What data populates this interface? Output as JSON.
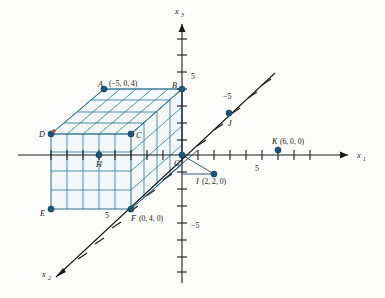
{
  "figure": {
    "background_color": "#fdfdfb",
    "axis_color": "#1a1a1a",
    "box_color": "#2e6d8e",
    "point_color": "#1b5579",
    "accent_color": "#b5432a"
  },
  "axes": [
    {
      "name": "x1",
      "label": "x",
      "subscript": "1",
      "direction": "right",
      "arrow": true
    },
    {
      "name": "x2",
      "label": "x",
      "subscript": "2",
      "direction": "lower-left",
      "arrow": true
    },
    {
      "name": "x3",
      "label": "x",
      "subscript": "3",
      "direction": "up",
      "arrow": true
    }
  ],
  "tick_labels": [
    {
      "name": "x3-positive-5",
      "text": "5",
      "axis": "x3",
      "value": 5
    },
    {
      "name": "x3-negative-5",
      "text": "-5",
      "axis": "x3",
      "value": -5
    },
    {
      "name": "x1-positive-5",
      "text": "5",
      "axis": "x1",
      "value": 5
    },
    {
      "name": "x2-positive-5",
      "text": "5",
      "axis": "x2",
      "value": 5
    },
    {
      "name": "x2-negative-5",
      "text": "-5",
      "axis": "x2",
      "value": -5
    }
  ],
  "points": [
    {
      "name": "point-A",
      "label": "A",
      "coords": "(-5, 0, 4)",
      "show_coords": true,
      "x": -5,
      "y": 0,
      "z": 4
    },
    {
      "name": "point-B",
      "label": "B",
      "coords": "(0, 0, 4)",
      "show_coords": false,
      "x": 0,
      "y": 0,
      "z": 4
    },
    {
      "name": "point-C",
      "label": "C",
      "coords": "(0, 0, 0)",
      "show_coords": false,
      "x": 0,
      "y": 0,
      "z": 0
    },
    {
      "name": "point-D",
      "label": "D",
      "coords": "(-5, 0, 0)",
      "show_coords": false,
      "x": -5,
      "y": 0,
      "z": 0
    },
    {
      "name": "point-E",
      "label": "E",
      "coords": "(-5, 0, -3)",
      "show_coords": false,
      "x": -5,
      "y": 0,
      "z": -3
    },
    {
      "name": "point-F",
      "label": "F",
      "coords": "(0, 4, 0)",
      "show_coords": true,
      "x": 0,
      "y": 4,
      "z": 0
    },
    {
      "name": "point-H",
      "label": "H",
      "coords": "(-3, 2, 0)",
      "show_coords": false,
      "x": -3,
      "y": 2,
      "z": 0
    },
    {
      "name": "point-I",
      "label": "I",
      "coords": "(2, 2, 0)",
      "show_coords": true,
      "x": 2,
      "y": 2,
      "z": 0
    },
    {
      "name": "point-J",
      "label": "J",
      "coords": "(0, -5, 0)",
      "show_coords": false,
      "x": 0,
      "y": -5,
      "z": 0
    },
    {
      "name": "point-K",
      "label": "K",
      "coords": "(6, 0, 0)",
      "show_coords": true,
      "x": 6,
      "y": 0,
      "z": 0
    },
    {
      "name": "point-G",
      "label": "G",
      "coords": "(0, 0, 0)",
      "show_coords": false,
      "x": 0,
      "y": 0,
      "z": 0
    }
  ],
  "labels": {
    "A": "A",
    "A_coords": "(−5, 0, 4)",
    "B": "B",
    "C": "C",
    "D": "D",
    "E": "E",
    "F": "F",
    "F_coords": "(0, 4, 0)",
    "G": "G",
    "H": "H",
    "I": "I",
    "I_coords": "(2, 2, 0)",
    "J": "J",
    "K": "K",
    "K_coords": "(6, 0, 0)",
    "axis_x": "x",
    "sub_1": "1",
    "sub_2": "2",
    "sub_3": "3",
    "tick_5": "5",
    "tick_neg5": "−5"
  }
}
